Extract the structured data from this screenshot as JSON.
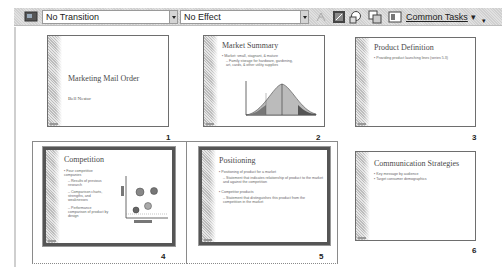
{
  "toolbar": {
    "slide_show_icon": "slide-show-icon",
    "transition": "No Transition",
    "effect": "No Effect",
    "common_tasks": "Common Tasks",
    "icons": [
      "animation-preview-icon",
      "hide-slide-icon",
      "rehearse-timings-icon",
      "summary-slide-icon",
      "show-formatting-icon"
    ]
  },
  "slides": [
    {
      "number": "1",
      "title": "Marketing Mail Order",
      "subtitle": "Bell Nestor",
      "selected": false
    },
    {
      "number": "2",
      "title": "Market Summary",
      "bullets": [
        "Market: small, stagnant, & mature",
        "Family storage for hardware, gardening, art, cards, & other utility supplies"
      ],
      "selected": false
    },
    {
      "number": "3",
      "title": "Product Definition",
      "bullets": [
        "Providing product launching lines (series 5.3)"
      ],
      "selected": false
    },
    {
      "number": "4",
      "title": "Competition",
      "bullets": [
        "Four competitive companies",
        "Results of previous research",
        "Comparison charts, strengths, and weaknesses",
        "Performance comparison of product by design"
      ],
      "selected": true
    },
    {
      "number": "5",
      "title": "Positioning",
      "bullets": [
        "Positioning of product for a market",
        "Statement that indicates relationship of product to the market and against the competition",
        "Competitor products",
        "Statement that distinguishes this product from the competition in the market"
      ],
      "selected": true
    },
    {
      "number": "6",
      "title": "Communication Strategies",
      "bullets": [
        "Key message by audience",
        "Target consumer demographics"
      ],
      "selected": false
    }
  ]
}
